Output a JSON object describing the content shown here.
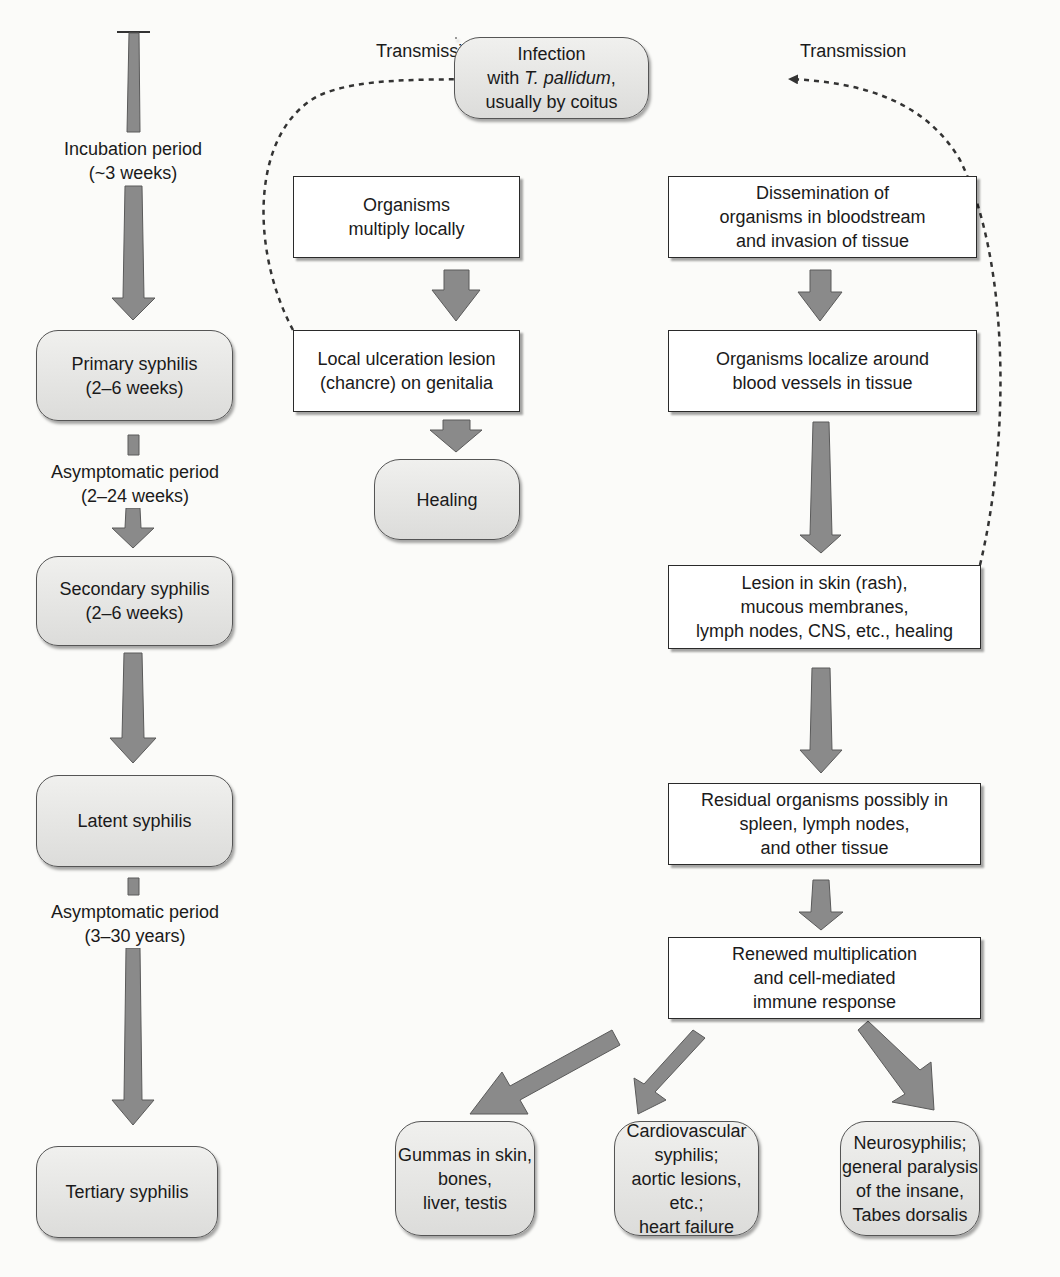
{
  "timeline": {
    "incubation": {
      "line1": "Incubation period",
      "line2": "(~3 weeks)"
    },
    "primary": {
      "line1": "Primary syphilis",
      "line2": "(2–6 weeks)"
    },
    "asymptomatic_1": {
      "line1": "Asymptomatic period",
      "line2": "(2–24 weeks)"
    },
    "secondary": {
      "line1": "Secondary syphilis",
      "line2": "(2–6 weeks)"
    },
    "latent": {
      "line1": "Latent syphilis"
    },
    "asymptomatic_2": {
      "line1": "Asymptomatic period",
      "line2": "(3–30 years)"
    },
    "tertiary": {
      "line1": "Tertiary syphilis"
    }
  },
  "top": {
    "transmission_left": "Transmission",
    "transmission_right": "Transmission",
    "infection": {
      "line1": "Infection",
      "line2_prefix": "with ",
      "line2_italic": "T. pallidum",
      "line2_suffix": ",",
      "line3": "usually by coitus"
    }
  },
  "local_branch": {
    "multiply": {
      "line1": "Organisms",
      "line2": "multiply locally"
    },
    "ulceration": {
      "line1": "Local ulceration lesion",
      "line2": "(chancre) on genitalia"
    },
    "healing": {
      "line1": "Healing"
    }
  },
  "systemic_branch": {
    "dissemination": {
      "line1": "Dissemination of",
      "line2": "organisms in bloodstream",
      "line3": "and invasion of tissue"
    },
    "localize": {
      "line1": "Organisms localize around",
      "line2": "blood vessels in tissue"
    },
    "lesion": {
      "line1": "Lesion in skin (rash),",
      "line2": "mucous membranes,",
      "line3": "lymph nodes, CNS, etc., healing"
    },
    "residual": {
      "line1": "Residual organisms possibly in",
      "line2": "spleen, lymph nodes,",
      "line3": "and other tissue"
    },
    "renewed": {
      "line1": "Renewed multiplication",
      "line2": "and cell-mediated",
      "line3": "immune response"
    }
  },
  "outcomes": {
    "gummas": {
      "line1": "Gummas in skin,",
      "line2": "bones,",
      "line3": "liver, testis"
    },
    "cardiovascular": {
      "line1": "Cardiovascular",
      "line2": "syphilis;",
      "line3": "aortic lesions, etc.;",
      "line4": "heart failure"
    },
    "neuro": {
      "line1": "Neurosyphilis;",
      "line2": "general paralysis",
      "line3": "of the insane,",
      "line4": "Tabes dorsalis"
    }
  },
  "colors": {
    "arrow_fill": "#8a8a8a",
    "arrow_stroke": "#5a5a5a",
    "pill_fill": "#e4e4e2",
    "box_border": "#2a2a2a",
    "background": "#fbfbf9"
  }
}
